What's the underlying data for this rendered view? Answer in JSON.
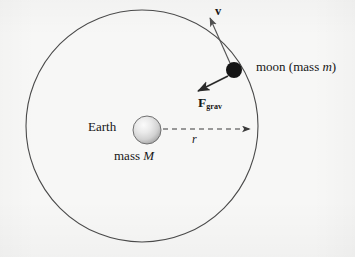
{
  "figure": {
    "background_color": "#f7f7f6",
    "ink_color": "#3a3a3a"
  },
  "labels": {
    "moon": "moon (mass ",
    "moon_symbol": "m",
    "moon_close": ")",
    "earth": "Earth",
    "mass_prefix": "mass ",
    "earth_mass_symbol": "M",
    "velocity": "v",
    "radius": "r",
    "force": "F",
    "force_subscript": "grav"
  },
  "diagram_data": {
    "type": "physics-vector-diagram",
    "orbit": {
      "name": "orbit-circle",
      "center_x": 142,
      "center_y": 126,
      "radius": 116,
      "stroke": "#4a4a4a",
      "stroke_width": 1.1,
      "fill": "none"
    },
    "earth": {
      "name": "earth-sphere",
      "center_x": 147,
      "center_y": 130,
      "radius": 14,
      "fill_light": "#f2f2f2",
      "fill_mid": "#d8d8d8",
      "fill_edge": "#9a9a9a",
      "outline": "#6e6e6e"
    },
    "moon": {
      "name": "moon-dot",
      "center_x": 234,
      "center_y": 70,
      "radius": 8,
      "fill": "#151515"
    },
    "radius_arrow": {
      "name": "radius-dashed-arrow",
      "x1": 163,
      "y1": 129,
      "x2": 252,
      "y2": 129,
      "dash": "5,4",
      "stroke": "#3a3a3a"
    },
    "velocity_vector": {
      "name": "velocity-arrow",
      "x1": 230,
      "y1": 63,
      "x2": 209,
      "y2": 16,
      "stroke": "#555555",
      "description": "tangent to orbit, pointing up-left"
    },
    "force_vector": {
      "name": "gravity-force-arrow",
      "x1": 228,
      "y1": 76,
      "x2": 197,
      "y2": 92,
      "stroke": "#2a2a2a",
      "description": "points from moon toward Earth"
    }
  }
}
